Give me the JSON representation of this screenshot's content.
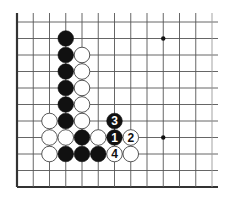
{
  "diagram": {
    "board": {
      "columns": 13,
      "rows": 11,
      "origin_x": 17,
      "origin_y": 22,
      "col_spacing": 16.25,
      "row_spacing": 16.5,
      "line_color": "#555555",
      "edge_color": "#333333",
      "edges": [
        "left",
        "bottom"
      ]
    },
    "star_points": [
      {
        "col": 9,
        "row": 1
      },
      {
        "col": 9,
        "row": 7
      }
    ],
    "stones": [
      {
        "color": "black",
        "col": 3,
        "row": 1
      },
      {
        "color": "black",
        "col": 3,
        "row": 2
      },
      {
        "color": "black",
        "col": 3,
        "row": 3
      },
      {
        "color": "black",
        "col": 3,
        "row": 4
      },
      {
        "color": "black",
        "col": 3,
        "row": 5
      },
      {
        "color": "black",
        "col": 3,
        "row": 6
      },
      {
        "color": "white",
        "col": 4,
        "row": 2
      },
      {
        "color": "white",
        "col": 4,
        "row": 3
      },
      {
        "color": "white",
        "col": 4,
        "row": 4
      },
      {
        "color": "white",
        "col": 4,
        "row": 5
      },
      {
        "color": "white",
        "col": 4,
        "row": 6
      },
      {
        "color": "white",
        "col": 2,
        "row": 6
      },
      {
        "color": "white",
        "col": 2,
        "row": 7
      },
      {
        "color": "white",
        "col": 3,
        "row": 7
      },
      {
        "color": "black",
        "col": 4,
        "row": 7
      },
      {
        "color": "white",
        "col": 5,
        "row": 7
      },
      {
        "color": "white",
        "col": 2,
        "row": 8
      },
      {
        "color": "black",
        "col": 3,
        "row": 8
      },
      {
        "color": "black",
        "col": 4,
        "row": 8
      },
      {
        "color": "black",
        "col": 5,
        "row": 8
      },
      {
        "color": "white",
        "col": 7,
        "row": 8
      }
    ],
    "numbered_moves": [
      {
        "number": "1",
        "color": "black",
        "col": 6,
        "row": 7
      },
      {
        "number": "2",
        "color": "white",
        "col": 7,
        "row": 7
      },
      {
        "number": "3",
        "color": "black",
        "col": 6,
        "row": 6
      },
      {
        "number": "4",
        "color": "white",
        "col": 6,
        "row": 8
      }
    ]
  }
}
